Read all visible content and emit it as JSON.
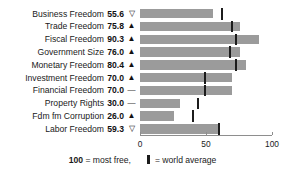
{
  "chart_data": {
    "type": "bar",
    "title": "",
    "xlabel": "",
    "ylabel": "",
    "xlim": [
      0,
      100
    ],
    "grid": false,
    "orientation": "horizontal",
    "legend_position": "bottom",
    "categories": [
      "Business Freedom",
      "Trade Freedom",
      "Fiscal Freedom",
      "Government Size",
      "Monetary Freedom",
      "Investment Freedom",
      "Financial Freedom",
      "Property Rights",
      "Fdm fm Corruption",
      "Labor Freedom"
    ],
    "values": [
      55.6,
      75.8,
      90.3,
      76.0,
      80.4,
      70.0,
      70.0,
      30.0,
      26.0,
      59.3
    ],
    "value_labels": [
      "55.6",
      "75.8",
      "90.3",
      "76.0",
      "80.4",
      "70.0",
      "70.0",
      "30.0",
      "26.0",
      "59.3"
    ],
    "trend_glyphs": [
      "▽",
      "▲",
      "▲",
      "▲",
      "▲",
      "▲",
      "—",
      "—",
      "▲",
      "▽"
    ],
    "trend_names": [
      "down",
      "up",
      "up",
      "up",
      "up",
      "up",
      "flat",
      "flat",
      "up",
      "down"
    ],
    "world_average": [
      62.0,
      70.0,
      73.0,
      68.0,
      73.0,
      49.0,
      49.0,
      44.0,
      40.0,
      60.0
    ],
    "ticks": [
      0,
      50,
      100
    ],
    "tick_labels": [
      "0",
      "50",
      "100"
    ],
    "bar_color": "#9b9b9b",
    "marker_color": "#1c1c1c",
    "axis_color": "#8e8e8e"
  },
  "caption": {
    "scale_value": "100",
    "scale_text": "= most free,",
    "legend_text": "= world average"
  }
}
